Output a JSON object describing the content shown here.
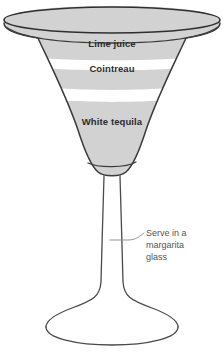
{
  "illustration": {
    "title": "Margarita glass layered drink diagram",
    "background_color": "#ffffff",
    "glass": {
      "outline_color": "#3a3a3a",
      "fill_color": "#d2d2d2",
      "separator_color": "#ffffff",
      "parts": [
        "rim",
        "bowl",
        "stem",
        "foot"
      ]
    },
    "layers": [
      {
        "id": "lime-juice",
        "label": "Lime juice",
        "order": 1,
        "position": "top",
        "label_x": 112,
        "label_y": 47
      },
      {
        "id": "cointreau",
        "label": "Cointreau",
        "order": 2,
        "position": "middle",
        "label_x": 112,
        "label_y": 72
      },
      {
        "id": "white-tequila",
        "label": "White tequila",
        "order": 3,
        "position": "bottom",
        "label_x": 112,
        "label_y": 125
      }
    ],
    "callout": {
      "id": "serve-note",
      "lines": [
        "Serve in a",
        "margarita",
        "glass"
      ],
      "text": "Serve in a margarita glass",
      "text_color": "#555555",
      "leader_color": "#777777",
      "anchor_x": 110,
      "anchor_y": 240,
      "text_x": 146,
      "text_y": 239
    }
  }
}
